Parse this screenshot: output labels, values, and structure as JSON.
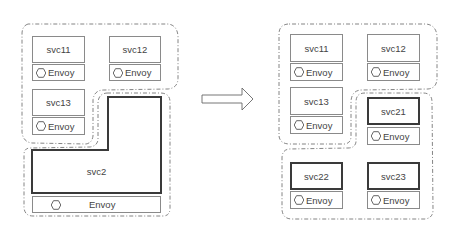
{
  "left": {
    "services": [
      {
        "id": "svc11",
        "label": "svc11",
        "envoy": "Envoy"
      },
      {
        "id": "svc12",
        "label": "svc12",
        "envoy": "Envoy"
      },
      {
        "id": "svc13",
        "label": "svc13",
        "envoy": "Envoy"
      },
      {
        "id": "svc2",
        "label": "svc2",
        "envoy": "Envoy"
      }
    ]
  },
  "right": {
    "services": [
      {
        "id": "svc11",
        "label": "svc11",
        "envoy": "Envoy"
      },
      {
        "id": "svc12",
        "label": "svc12",
        "envoy": "Envoy"
      },
      {
        "id": "svc13",
        "label": "svc13",
        "envoy": "Envoy"
      },
      {
        "id": "svc21",
        "label": "svc21",
        "envoy": "Envoy"
      },
      {
        "id": "svc22",
        "label": "svc22",
        "envoy": "Envoy"
      },
      {
        "id": "svc23",
        "label": "svc23",
        "envoy": "Envoy"
      }
    ]
  },
  "arrow": {
    "icon": "right-arrow-icon"
  },
  "colors": {
    "border": "#8a8a8a",
    "thick_border": "#3a3a3a",
    "dashed": "#777777"
  }
}
